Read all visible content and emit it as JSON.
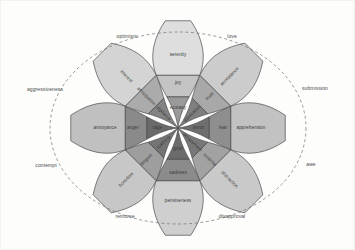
{
  "diagram": {
    "center": {
      "x": 177,
      "y": 127
    },
    "background_color": "#fdfdfc",
    "outline_color": "#4a4a4a",
    "dashed_ring": {
      "rx": 128,
      "ry": 96,
      "color": "#6e6e6e"
    },
    "ring_radii": {
      "inner": 33,
      "middle": 57,
      "outer": 81,
      "tip": 108
    },
    "petal_half_width_deg": 22.5
  },
  "petals": [
    {
      "name": "joy",
      "angle": -90,
      "colors": {
        "intense": "#9a9a9a",
        "basic": "#c4c4c4",
        "mild": "#dedede"
      },
      "levels": [
        {
          "label": "ecstasy",
          "intensity": "intense"
        },
        {
          "label": "joy",
          "intensity": "basic"
        },
        {
          "label": "serenity",
          "intensity": "mild"
        }
      ]
    },
    {
      "name": "trust",
      "angle": -45,
      "colors": {
        "intense": "#7f7f7f",
        "basic": "#a8a8a8",
        "mild": "#cccccc"
      },
      "levels": [
        {
          "label": "admiration",
          "intensity": "intense"
        },
        {
          "label": "trust",
          "intensity": "basic"
        },
        {
          "label": "acceptance",
          "intensity": "mild"
        }
      ]
    },
    {
      "name": "fear",
      "angle": 0,
      "colors": {
        "intense": "#6e6e6e",
        "basic": "#8e8e8e",
        "mild": "#c2c2c2"
      },
      "levels": [
        {
          "label": "terror",
          "intensity": "intense"
        },
        {
          "label": "fear",
          "intensity": "basic"
        },
        {
          "label": "apprehension",
          "intensity": "mild"
        }
      ]
    },
    {
      "name": "surprise",
      "angle": 45,
      "colors": {
        "intense": "#787878",
        "basic": "#a2a2a2",
        "mild": "#c9c9c9"
      },
      "levels": [
        {
          "label": "amazement",
          "intensity": "intense"
        },
        {
          "label": "surprise",
          "intensity": "basic"
        },
        {
          "label": "distraction",
          "intensity": "mild"
        }
      ]
    },
    {
      "name": "sadness",
      "angle": 90,
      "colors": {
        "intense": "#6b6b6b",
        "basic": "#8b8b8b",
        "mild": "#cfcfcf"
      },
      "levels": [
        {
          "label": "grief",
          "intensity": "intense"
        },
        {
          "label": "sadness",
          "intensity": "basic"
        },
        {
          "label": "pensiveness",
          "intensity": "mild"
        }
      ]
    },
    {
      "name": "disgust",
      "angle": 135,
      "colors": {
        "intense": "#747474",
        "basic": "#9e9e9e",
        "mild": "#c7c7c7"
      },
      "levels": [
        {
          "label": "loathing",
          "intensity": "intense"
        },
        {
          "label": "disgust",
          "intensity": "basic"
        },
        {
          "label": "boredom",
          "intensity": "mild"
        }
      ]
    },
    {
      "name": "anger",
      "angle": 180,
      "colors": {
        "intense": "#6a6a6a",
        "basic": "#8a8a8a",
        "mild": "#c0c0c0"
      },
      "levels": [
        {
          "label": "rage",
          "intensity": "intense"
        },
        {
          "label": "anger",
          "intensity": "basic"
        },
        {
          "label": "annoyance",
          "intensity": "mild"
        }
      ]
    },
    {
      "name": "anticipation",
      "angle": -135,
      "colors": {
        "intense": "#838383",
        "basic": "#ababab",
        "mild": "#d4d4d4"
      },
      "levels": [
        {
          "label": "vigilance",
          "intensity": "intense"
        },
        {
          "label": "anticipation",
          "intensity": "basic"
        },
        {
          "label": "interest",
          "intensity": "mild"
        }
      ]
    }
  ],
  "dyads": [
    {
      "label": "optimism",
      "x": 126,
      "y": 36
    },
    {
      "label": "love",
      "x": 231,
      "y": 36
    },
    {
      "label": "submission",
      "x": 314,
      "y": 88
    },
    {
      "label": "awe",
      "x": 310,
      "y": 164
    },
    {
      "label": "disapproval",
      "x": 231,
      "y": 216
    },
    {
      "label": "remorse",
      "x": 124,
      "y": 216
    },
    {
      "label": "contempt",
      "x": 45,
      "y": 165
    },
    {
      "label": "aggressiveness",
      "x": 44,
      "y": 89
    }
  ]
}
